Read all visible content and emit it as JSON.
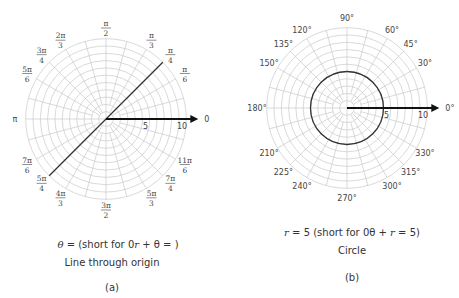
{
  "figures": [
    {
      "id": "a",
      "title": "Line through origin",
      "panel_label": "(a)",
      "equation": {
        "lhs": "θ",
        "eq": " = ",
        "value_num": "π",
        "value_den": "4",
        "short_prefix": " (short for 0",
        "short_r": "r",
        "short_mid": " + θ = ",
        "short_num": "π",
        "short_den": "4",
        "short_suffix": ")"
      },
      "angle_labels": [
        {
          "angle_deg": 0,
          "text": "0"
        },
        {
          "angle_deg": 30,
          "num": "π",
          "den": "6"
        },
        {
          "angle_deg": 45,
          "num": "π",
          "den": "4"
        },
        {
          "angle_deg": 60,
          "num": "π",
          "den": "3"
        },
        {
          "angle_deg": 90,
          "num": "π",
          "den": "2"
        },
        {
          "angle_deg": 120,
          "num": "2π",
          "den": "3"
        },
        {
          "angle_deg": 135,
          "num": "3π",
          "den": "4"
        },
        {
          "angle_deg": 150,
          "num": "5π",
          "den": "6"
        },
        {
          "angle_deg": 180,
          "text": "π"
        },
        {
          "angle_deg": 210,
          "num": "7π",
          "den": "6"
        },
        {
          "angle_deg": 225,
          "num": "5π",
          "den": "4"
        },
        {
          "angle_deg": 240,
          "num": "4π",
          "den": "3"
        },
        {
          "angle_deg": 270,
          "num": "3π",
          "den": "2"
        },
        {
          "angle_deg": 300,
          "num": "5π",
          "den": "3"
        },
        {
          "angle_deg": 315,
          "num": "7π",
          "den": "4"
        },
        {
          "angle_deg": 330,
          "num": "11π",
          "den": "6"
        }
      ],
      "radial_labels": [
        "5",
        "10"
      ],
      "graph": {
        "type": "line",
        "angle_deg": 45
      }
    },
    {
      "id": "b",
      "title": "Circle",
      "panel_label": "(b)",
      "equation": {
        "lhs": "r",
        "eq": " = 5",
        "short_prefix": " (short for 0θ + ",
        "short_r": "r",
        "short_suffix": " = 5)"
      },
      "angle_labels": [
        {
          "angle_deg": 0,
          "text": "0°"
        },
        {
          "angle_deg": 30,
          "text": "30°"
        },
        {
          "angle_deg": 45,
          "text": "45°"
        },
        {
          "angle_deg": 60,
          "text": "60°"
        },
        {
          "angle_deg": 90,
          "text": "90°"
        },
        {
          "angle_deg": 120,
          "text": "120°"
        },
        {
          "angle_deg": 135,
          "text": "135°"
        },
        {
          "angle_deg": 150,
          "text": "150°"
        },
        {
          "angle_deg": 180,
          "text": "180°"
        },
        {
          "angle_deg": 210,
          "text": "210°"
        },
        {
          "angle_deg": 225,
          "text": "225°"
        },
        {
          "angle_deg": 240,
          "text": "240°"
        },
        {
          "angle_deg": 270,
          "text": "270°"
        },
        {
          "angle_deg": 300,
          "text": "300°"
        },
        {
          "angle_deg": 315,
          "text": "315°"
        },
        {
          "angle_deg": 330,
          "text": "330°"
        }
      ],
      "radial_labels": [
        "5",
        "10"
      ],
      "graph": {
        "type": "circle",
        "radius": 5
      }
    }
  ],
  "grid": {
    "max_radius": 11,
    "ring_step": 1,
    "spoke_step_deg": 15,
    "grid_color": "#c9c9c9",
    "curve_color": "#333333"
  }
}
